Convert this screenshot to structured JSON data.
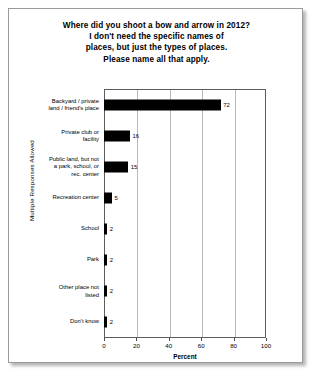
{
  "chart_data": {
    "type": "bar",
    "orientation": "horizontal",
    "title": "Where did you shoot a bow and arrow in 2012? I don't need the specific names of places, but just the types of places. Please name all that apply.",
    "title_lines": [
      "Where did you shoot a bow and arrow in 2012?",
      "I don't need the specific names of",
      "places, but just the types of places.",
      "Please name all that apply."
    ],
    "categories": [
      "Backyard / private land / friend's place",
      "Private club or facility",
      "Public land, but not a park, school, or rec. center",
      "Recreation center",
      "School",
      "Park",
      "Other place not listed",
      "Don't know"
    ],
    "category_lines": [
      [
        "Backyard / private",
        "land / friend's place"
      ],
      [
        "Private club or",
        "facility"
      ],
      [
        "Public land, but not",
        "a park, school, or",
        "rec. center"
      ],
      [
        "Recreation center"
      ],
      [
        "School"
      ],
      [
        "Park"
      ],
      [
        "Other place not",
        "listed"
      ],
      [
        "Don't know"
      ]
    ],
    "values": [
      72,
      16,
      15,
      5,
      2,
      2,
      2,
      2
    ],
    "value_labels": [
      "72",
      "16",
      "15",
      "5",
      "2",
      "2",
      "2",
      "2"
    ],
    "xlabel": "Percent",
    "ylabel": "Multiple Responses Allowed",
    "xlim": [
      0,
      100
    ],
    "xticks": [
      0,
      20,
      40,
      60,
      80,
      100
    ],
    "xtick_labels": [
      "0",
      "20",
      "40",
      "60",
      "80",
      "100"
    ],
    "grid": "vertical",
    "legend": "none",
    "bar_color": "#000000",
    "background_color": "#FFFFFF"
  }
}
